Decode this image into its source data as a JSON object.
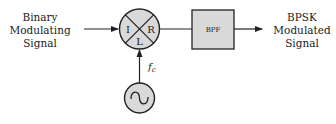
{
  "diagram": {
    "input_label": [
      "Binary",
      "Modulating",
      "Signal"
    ],
    "output_label": [
      "BPSK",
      "Modulated",
      "Signal"
    ],
    "mixer": {
      "port_i": "I",
      "port_r": "R",
      "port_l": "L"
    },
    "filter": {
      "label": "BPF"
    },
    "oscillator": {
      "freq_label_main": "f",
      "freq_label_sub": "c",
      "symbol": "sine-wave"
    },
    "colors": {
      "block_fill": "#d9d9d9",
      "stroke": "#222222",
      "background": "#ffffff"
    }
  }
}
